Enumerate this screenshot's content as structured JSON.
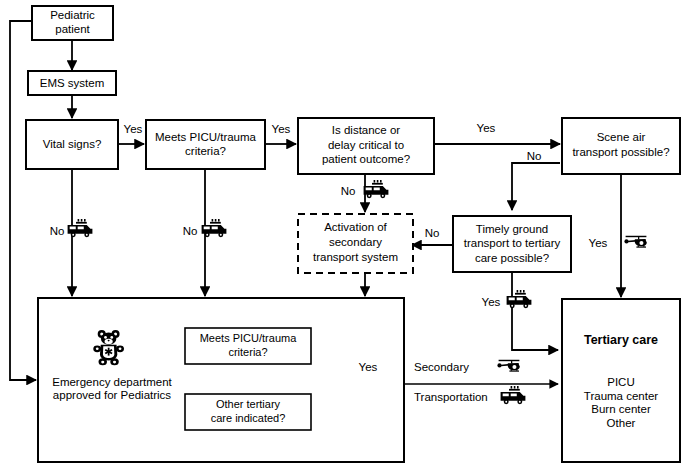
{
  "diagram": {
    "background_color": "#ffffff",
    "line_color": "#000000"
  },
  "nodes": {
    "pediatric_patient": {
      "lines": [
        "Pediatric",
        "patient"
      ]
    },
    "ems_system": {
      "lines": [
        "EMS system"
      ]
    },
    "vital_signs": {
      "lines": [
        "Vital signs?"
      ]
    },
    "meets_picu_trauma": {
      "lines": [
        "Meets PICU/trauma",
        "criteria?"
      ]
    },
    "distance_delay": {
      "lines": [
        "Is distance or",
        "delay critical to",
        "patient outcome?"
      ]
    },
    "scene_air": {
      "lines": [
        "Scene air",
        "transport possible?"
      ]
    },
    "activation_secondary": {
      "lines": [
        "Activation of",
        "secondary",
        "transport system"
      ]
    },
    "timely_ground": {
      "lines": [
        "Timely ground",
        "transport to tertiary",
        "care possible?"
      ]
    },
    "emergency_department": {
      "lines": [
        "Emergency department",
        "approved for Pediatrics"
      ]
    },
    "ed_meets_picu_trauma": {
      "lines": [
        "Meets PICU/trauma",
        "criteria?"
      ]
    },
    "ed_other_tertiary": {
      "lines": [
        "Other tertiary",
        "care indicated?"
      ]
    },
    "tertiary_care": {
      "title": "Tertiary care",
      "items": [
        "PICU",
        "Trauma center",
        "Burn center",
        "Other"
      ]
    }
  },
  "edge_labels": {
    "vital_yes": "Yes",
    "vital_no": "No",
    "picu_yes": "Yes",
    "picu_no": "No",
    "distance_yes": "Yes",
    "distance_no": "No",
    "scene_air_no": "No",
    "scene_air_yes": "Yes",
    "timely_no": "No",
    "timely_yes": "Yes",
    "ed_yes": "Yes",
    "secondary": "Secondary",
    "transportation": "Transportation"
  },
  "icons": {
    "ambulance_vital": "ambulance-icon",
    "ambulance_picu": "ambulance-icon",
    "ambulance_distance": "ambulance-icon",
    "ambulance_timely": "ambulance-icon",
    "ambulance_transport": "ambulance-icon",
    "helicopter_scene_air": "helicopter-icon",
    "helicopter_secondary": "helicopter-icon",
    "teddy_bear": "teddy-bear-icon"
  }
}
